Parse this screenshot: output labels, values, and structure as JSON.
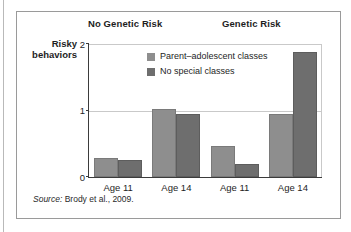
{
  "figure": {
    "source_label": "Source:",
    "source_text": " Brody et al., 2009."
  },
  "chart_data": {
    "type": "bar",
    "title": "",
    "xlabel": "",
    "ylabel": "Risky behaviors",
    "ylabel_line1": "Risky",
    "ylabel_line2": "behaviors",
    "ylim": [
      0,
      2
    ],
    "yticks": [
      "0",
      "1",
      "2"
    ],
    "ytick_values": [
      0,
      1,
      2
    ],
    "grid": "horizontal gridline at y=1",
    "legend_position": "inside top-left of plot area",
    "group_headers": [
      "No Genetic Risk",
      "Genetic Risk"
    ],
    "categories": [
      "Age 11",
      "Age 14",
      "Age 11",
      "Age 14"
    ],
    "series": [
      {
        "name": "Parent–adolescent classes",
        "color": "#8e8e8e",
        "values": [
          0.25,
          1.0,
          0.43,
          0.92
        ]
      },
      {
        "name": "No special classes",
        "color": "#6e6e6e",
        "values": [
          0.22,
          0.92,
          0.17,
          1.85
        ]
      }
    ]
  }
}
